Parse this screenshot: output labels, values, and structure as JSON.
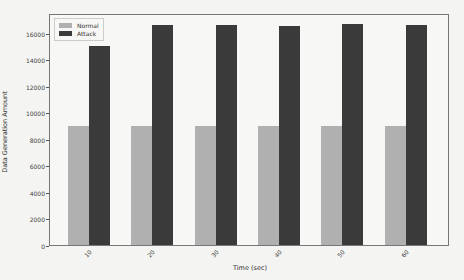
{
  "chart_data": {
    "type": "bar",
    "title": "",
    "xlabel": "Time (sec)",
    "ylabel": "Data Generation Amount",
    "categories": [
      "10",
      "20",
      "30",
      "40",
      "50",
      "60"
    ],
    "series": [
      {
        "name": "Normal",
        "color": "#b0b0b0",
        "values": [
          8950,
          8950,
          8950,
          8950,
          8950,
          8950
        ]
      },
      {
        "name": "Attack",
        "color": "#3a3a3a",
        "values": [
          15000,
          16600,
          16600,
          16550,
          16650,
          16600
        ]
      }
    ],
    "ylim": [
      0,
      17500
    ],
    "yticks": [
      "0",
      "2000",
      "4000",
      "6000",
      "8000",
      "10000",
      "12000",
      "14000",
      "16000"
    ],
    "legend_position": "upper left",
    "grid": false
  }
}
